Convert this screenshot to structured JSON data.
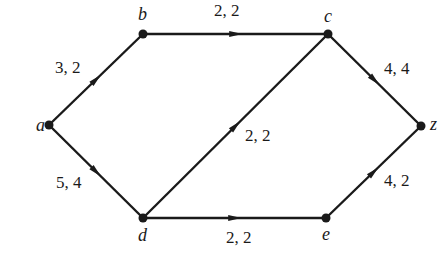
{
  "diagram": {
    "type": "flow-network",
    "nodes": [
      {
        "id": "a",
        "label": "a",
        "x": 49,
        "y": 125,
        "lx": 36,
        "ly": 131
      },
      {
        "id": "b",
        "label": "b",
        "x": 143,
        "y": 34,
        "lx": 138,
        "ly": 20
      },
      {
        "id": "c",
        "label": "c",
        "x": 328,
        "y": 34,
        "lx": 324,
        "ly": 22
      },
      {
        "id": "z",
        "label": "z",
        "x": 421,
        "y": 126,
        "lx": 430,
        "ly": 130
      },
      {
        "id": "d",
        "label": "d",
        "x": 143,
        "y": 218,
        "lx": 138,
        "ly": 241
      },
      {
        "id": "e",
        "label": "e",
        "x": 326,
        "y": 218,
        "lx": 322,
        "ly": 240
      }
    ],
    "edges": [
      {
        "from": "a",
        "to": "b",
        "label": "3, 2",
        "lx": 55,
        "ly": 73
      },
      {
        "from": "b",
        "to": "c",
        "label": "2, 2",
        "lx": 214,
        "ly": 16
      },
      {
        "from": "c",
        "to": "z",
        "label": "4, 4",
        "lx": 384,
        "ly": 74
      },
      {
        "from": "a",
        "to": "d",
        "label": "5, 4",
        "lx": 56,
        "ly": 188
      },
      {
        "from": "d",
        "to": "c",
        "label": "2, 2",
        "lx": 245,
        "ly": 141
      },
      {
        "from": "d",
        "to": "e",
        "label": "2, 2",
        "lx": 226,
        "ly": 243
      },
      {
        "from": "e",
        "to": "z",
        "label": "4, 2",
        "lx": 384,
        "ly": 186
      }
    ]
  }
}
